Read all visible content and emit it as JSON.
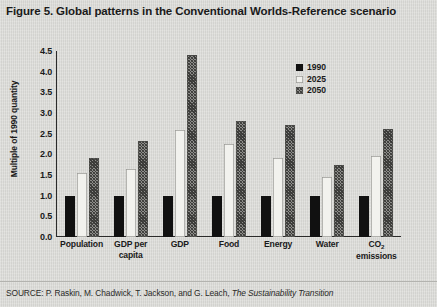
{
  "figure": {
    "title": "Figure 5. Global patterns in the Conventional Worlds-Reference scenario",
    "source_prefix": "SOURCE: P. Raskin, M. Chadwick, T. Jackson, and G. Leach, ",
    "source_italic": "The Sustainability Transition"
  },
  "chart_data": {
    "type": "bar",
    "title": "Figure 5. Global patterns in the Conventional Worlds-Reference scenario",
    "xlabel": "",
    "ylabel": "Multiple of 1990 quantity",
    "ylim": [
      0.0,
      4.5
    ],
    "ytick_labels": [
      "0.0",
      "0.5",
      "1.0",
      "1.5",
      "2.0",
      "2.5",
      "3.0",
      "3.5",
      "4.0",
      "4.5"
    ],
    "ytick_values": [
      0.0,
      0.5,
      1.0,
      1.5,
      2.0,
      2.5,
      3.0,
      3.5,
      4.0,
      4.5
    ],
    "grid": false,
    "legend_position": "upper right (inside plot)",
    "categories": [
      "Population",
      "GDP per capita",
      "GDP",
      "Food",
      "Energy",
      "Water",
      "CO2 emissions"
    ],
    "category_labels_display": [
      "Population",
      "GDP per\ncapita",
      "GDP",
      "Food",
      "Energy",
      "Water",
      "CO₂\nemissions"
    ],
    "series": [
      {
        "name": "1990",
        "color": "#111111",
        "style": "solid-black",
        "values": [
          1.0,
          1.0,
          1.0,
          1.0,
          1.0,
          1.0,
          1.0
        ]
      },
      {
        "name": "2025",
        "color": "#f2f2ee",
        "style": "solid-white",
        "values": [
          1.55,
          1.65,
          2.6,
          2.25,
          1.9,
          1.45,
          1.95
        ]
      },
      {
        "name": "2050",
        "color": "#8d8d8a",
        "style": "cross-hatched-gray",
        "values": [
          1.9,
          2.33,
          4.4,
          2.8,
          2.72,
          1.75,
          2.62
        ]
      }
    ]
  }
}
